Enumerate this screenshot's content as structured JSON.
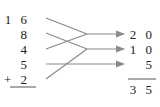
{
  "diagram": {
    "addends": [
      "1 6",
      "8",
      "4",
      "5",
      "+ 2"
    ],
    "partial_sums": [
      "2 0",
      "1 0",
      "5"
    ],
    "total": "3 5",
    "groupings": [
      {
        "from": [
          "16",
          "4"
        ],
        "to": "20"
      },
      {
        "from": [
          "8",
          "2"
        ],
        "to": "10"
      },
      {
        "from": [
          "5"
        ],
        "to": "5"
      }
    ],
    "line_color": "#8a8a8a",
    "text_color": "#222222"
  }
}
